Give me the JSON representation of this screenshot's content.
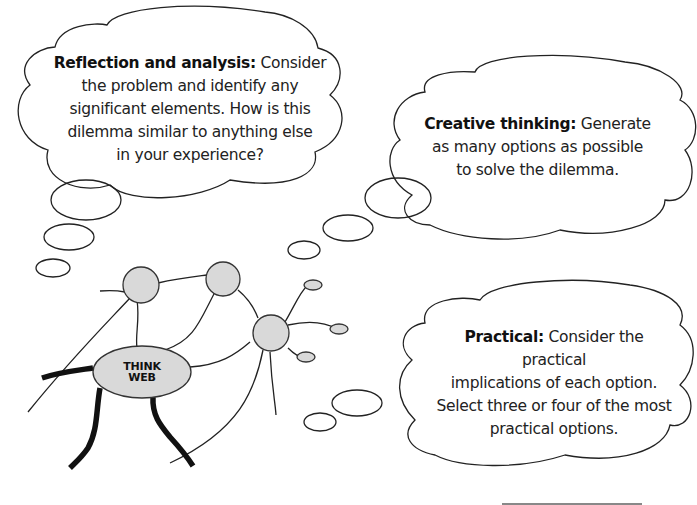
{
  "clouds": [
    {
      "id": "reflection",
      "heading": "Reflection and analysis:",
      "body_lines": [
        "Consider",
        "the problem and identify any",
        "significant elements. How is this",
        "dilemma similar to anything else",
        "in your experience?"
      ]
    },
    {
      "id": "creative",
      "heading": "Creative thinking:",
      "body_lines": [
        "Generate",
        "as many options as possible",
        "to solve the dilemma."
      ]
    },
    {
      "id": "practical",
      "heading": "Practical:",
      "body_lines": [
        "Consider the practical",
        "implications of each option.",
        "Select three or four of the most",
        "practical options."
      ]
    }
  ],
  "think_web": {
    "line1": "THINK",
    "line2": "WEB"
  },
  "colors": {
    "stroke": "#222222",
    "node_fill": "#d9d9d9",
    "background": "#ffffff"
  }
}
